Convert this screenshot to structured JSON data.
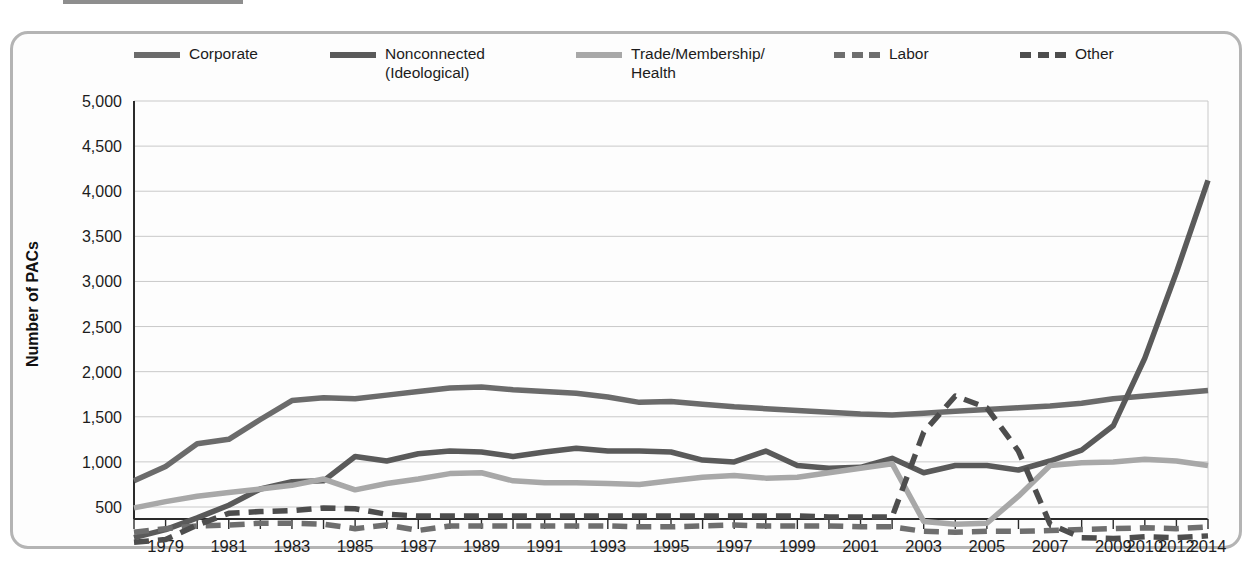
{
  "title": {
    "text": "Growth of PACs, 1978-2014",
    "swatch_color": "#8e8e8e"
  },
  "axis": {
    "ylabel": "Number of PACs",
    "ytick_labels": [
      "5,000",
      "4,500",
      "4,000",
      "3,500",
      "3,000",
      "2,500",
      "2,000",
      "1,500",
      "1,000",
      "500"
    ],
    "ytick_values": [
      5000,
      4500,
      4000,
      3500,
      3000,
      2500,
      2000,
      1500,
      1000,
      500
    ],
    "xtick_labels": [
      "1979",
      "1981",
      "1983",
      "1985",
      "1987",
      "1989",
      "1991",
      "1993",
      "1995",
      "1997",
      "1999",
      "2001",
      "2003",
      "2005",
      "2007",
      "2009",
      "2010",
      "2012",
      "2014"
    ]
  },
  "legend": [
    {
      "label": "Corporate",
      "color": "#6b6b6b",
      "style": "solid"
    },
    {
      "label": "Nonconnected\n(Ideological)",
      "color": "#5a5a5a",
      "style": "solid"
    },
    {
      "label": "Trade/Membership/\nHealth",
      "color": "#a8a8a8",
      "style": "solid"
    },
    {
      "label": "Labor",
      "color": "#6e6e6e",
      "style": "dashed"
    },
    {
      "label": "Other",
      "color": "#4d4d4d",
      "style": "dashed"
    }
  ],
  "chart_data": {
    "type": "line",
    "title": "Growth of PACs, 1978-2014",
    "xlabel": "",
    "ylabel": "Number of PACs",
    "ylim": [
      0,
      5000
    ],
    "grid": true,
    "legend_position": "top",
    "x": [
      1978,
      1979,
      1980,
      1981,
      1982,
      1983,
      1984,
      1985,
      1986,
      1987,
      1988,
      1989,
      1990,
      1991,
      1992,
      1993,
      1994,
      1995,
      1996,
      1997,
      1998,
      1999,
      2000,
      2001,
      2002,
      2003,
      2004,
      2005,
      2006,
      2007,
      2008,
      2009,
      2010,
      2012,
      2014
    ],
    "xtick_labels": [
      "1979",
      "1981",
      "1983",
      "1985",
      "1987",
      "1989",
      "1991",
      "1993",
      "1995",
      "1997",
      "1999",
      "2001",
      "2003",
      "2005",
      "2007",
      "2009",
      "2010",
      "2012",
      "2014"
    ],
    "series": [
      {
        "name": "Corporate",
        "color": "#6b6b6b",
        "style": "solid",
        "values": [
          790,
          950,
          1200,
          1250,
          1470,
          1680,
          1710,
          1700,
          1740,
          1780,
          1820,
          1830,
          1800,
          1780,
          1760,
          1720,
          1660,
          1670,
          1640,
          1610,
          1590,
          1570,
          1550,
          1530,
          1520,
          1540,
          1560,
          1580,
          1600,
          1620,
          1650,
          1700,
          1730,
          1760,
          1790
        ]
      },
      {
        "name": "Nonconnected (Ideological)",
        "color": "#5a5a5a",
        "style": "solid",
        "values": [
          160,
          250,
          380,
          520,
          700,
          780,
          790,
          1060,
          1010,
          1090,
          1120,
          1110,
          1060,
          1110,
          1150,
          1120,
          1120,
          1110,
          1020,
          1000,
          1120,
          960,
          930,
          940,
          1040,
          880,
          960,
          960,
          910,
          1010,
          1130,
          1400,
          2150,
          3100,
          4120
        ]
      },
      {
        "name": "Trade/Membership/Health",
        "color": "#a8a8a8",
        "style": "solid",
        "values": [
          490,
          560,
          620,
          660,
          700,
          740,
          810,
          690,
          760,
          810,
          870,
          880,
          790,
          770,
          770,
          760,
          750,
          790,
          830,
          850,
          820,
          830,
          880,
          930,
          980,
          340,
          310,
          320,
          620,
          960,
          990,
          1000,
          1030,
          1010,
          960
        ]
      },
      {
        "name": "Labor",
        "color": "#6e6e6e",
        "style": "dashed",
        "values": [
          220,
          260,
          290,
          300,
          320,
          320,
          310,
          260,
          300,
          240,
          290,
          290,
          290,
          290,
          290,
          290,
          280,
          280,
          290,
          300,
          290,
          290,
          290,
          280,
          280,
          230,
          220,
          230,
          230,
          240,
          250,
          260,
          270,
          260,
          280
        ]
      },
      {
        "name": "Other",
        "color": "#4d4d4d",
        "style": "dashed",
        "values": [
          110,
          140,
          300,
          430,
          450,
          460,
          490,
          480,
          420,
          400,
          400,
          400,
          400,
          400,
          400,
          400,
          400,
          400,
          400,
          400,
          400,
          400,
          390,
          390,
          390,
          1330,
          1730,
          1600,
          1120,
          310,
          160,
          150,
          170,
          160,
          180
        ]
      }
    ],
    "annotations": {
      "nonconnected_peak": {
        "year": 2004,
        "value": 4850
      },
      "other_peak": {
        "year": 2004,
        "value": 1730
      }
    }
  }
}
